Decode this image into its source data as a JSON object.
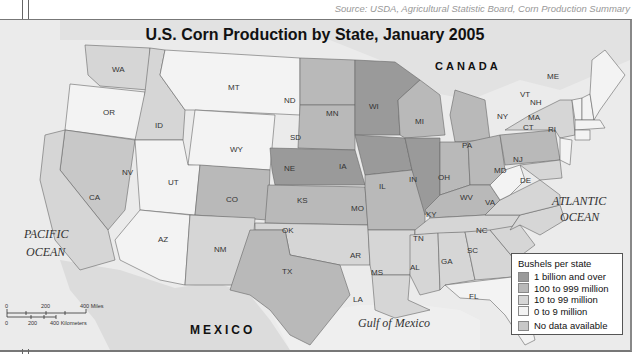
{
  "page": {
    "heading_fragment": "Using a Map Key",
    "source": "Source: USDA, Agricultural Statistic Board, Corn Production Summary"
  },
  "map": {
    "title": "U.S. Corn Production by State, January 2005",
    "labels": {
      "canada": "CANADA",
      "mexico": "MEXICO",
      "pacific_1": "PACIFIC",
      "pacific_2": "OCEAN",
      "atlantic_1": "ATLANTIC",
      "atlantic_2": "OCEAN",
      "gulf": "Gulf of Mexico"
    },
    "scale": {
      "miles_ticks": [
        "0",
        "200",
        "400 Miles"
      ],
      "km_ticks": [
        "0",
        "200",
        "400 Kilometers"
      ]
    },
    "legend": {
      "title": "Bushels per state",
      "items": [
        {
          "label": "1 billion and over",
          "color": "#9a9a9a"
        },
        {
          "label": "100 to 999 million",
          "color": "#b9b9b9"
        },
        {
          "label": "10 to 99 million",
          "color": "#d6d6d6"
        },
        {
          "label": "0 to 9 million",
          "color": "#f3f3f3"
        },
        {
          "label": "No data available",
          "color": "#c8c8c8"
        }
      ]
    },
    "states": [
      {
        "abbr": "WA",
        "category": "10 to 99 million"
      },
      {
        "abbr": "OR",
        "category": "0 to 9 million"
      },
      {
        "abbr": "ID",
        "category": "10 to 99 million"
      },
      {
        "abbr": "MT",
        "category": "0 to 9 million"
      },
      {
        "abbr": "WY",
        "category": "0 to 9 million"
      },
      {
        "abbr": "NV",
        "category": "No data available"
      },
      {
        "abbr": "UT",
        "category": "0 to 9 million"
      },
      {
        "abbr": "CA",
        "category": "10 to 99 million"
      },
      {
        "abbr": "AZ",
        "category": "0 to 9 million"
      },
      {
        "abbr": "CO",
        "category": "100 to 999 million"
      },
      {
        "abbr": "NM",
        "category": "10 to 99 million"
      },
      {
        "abbr": "ND",
        "category": "100 to 999 million"
      },
      {
        "abbr": "SD",
        "category": "100 to 999 million"
      },
      {
        "abbr": "NE",
        "category": "1 billion and over"
      },
      {
        "abbr": "KS",
        "category": "100 to 999 million"
      },
      {
        "abbr": "OK",
        "category": "10 to 99 million"
      },
      {
        "abbr": "TX",
        "category": "100 to 999 million"
      },
      {
        "abbr": "MN",
        "category": "1 billion and over"
      },
      {
        "abbr": "IA",
        "category": "1 billion and over"
      },
      {
        "abbr": "MO",
        "category": "100 to 999 million"
      },
      {
        "abbr": "AR",
        "category": "10 to 99 million"
      },
      {
        "abbr": "LA",
        "category": "10 to 99 million"
      },
      {
        "abbr": "WI",
        "category": "100 to 999 million"
      },
      {
        "abbr": "IL",
        "category": "1 billion and over"
      },
      {
        "abbr": "MI",
        "category": "100 to 999 million"
      },
      {
        "abbr": "IN",
        "category": "100 to 999 million"
      },
      {
        "abbr": "OH",
        "category": "100 to 999 million"
      },
      {
        "abbr": "KY",
        "category": "100 to 999 million"
      },
      {
        "abbr": "TN",
        "category": "10 to 99 million"
      },
      {
        "abbr": "MS",
        "category": "10 to 99 million"
      },
      {
        "abbr": "AL",
        "category": "10 to 99 million"
      },
      {
        "abbr": "GA",
        "category": "10 to 99 million"
      },
      {
        "abbr": "FL",
        "category": "0 to 9 million"
      },
      {
        "abbr": "SC",
        "category": "10 to 99 million"
      },
      {
        "abbr": "NC",
        "category": "10 to 99 million"
      },
      {
        "abbr": "VA",
        "category": "10 to 99 million"
      },
      {
        "abbr": "WV",
        "category": "0 to 9 million"
      },
      {
        "abbr": "PA",
        "category": "100 to 999 million"
      },
      {
        "abbr": "NY",
        "category": "10 to 99 million"
      },
      {
        "abbr": "MD",
        "category": "10 to 99 million"
      },
      {
        "abbr": "DE",
        "category": "10 to 99 million"
      },
      {
        "abbr": "NJ",
        "category": "0 to 9 million"
      },
      {
        "abbr": "VT",
        "category": "0 to 9 million"
      },
      {
        "abbr": "NH",
        "category": "0 to 9 million"
      },
      {
        "abbr": "ME",
        "category": "0 to 9 million"
      },
      {
        "abbr": "MA",
        "category": "0 to 9 million"
      },
      {
        "abbr": "CT",
        "category": "0 to 9 million"
      },
      {
        "abbr": "RI",
        "category": "0 to 9 million"
      }
    ]
  }
}
